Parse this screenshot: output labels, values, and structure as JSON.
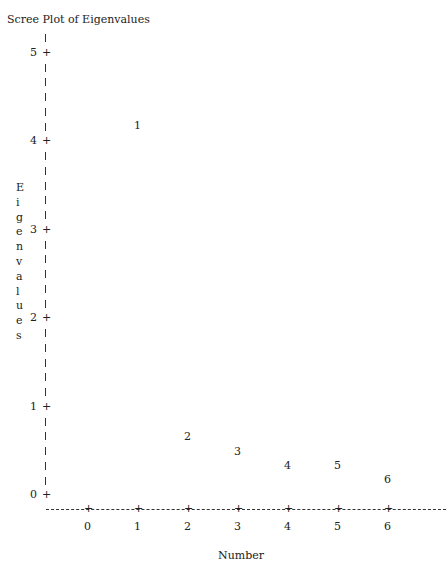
{
  "chart_data": {
    "type": "scatter",
    "title": "Scree Plot of Eigenvalues",
    "xlabel": "Number",
    "ylabel": "Eigenvalues",
    "x_ticks": [
      "0",
      "1",
      "2",
      "3",
      "4",
      "5",
      "6"
    ],
    "y_ticks": [
      "0",
      "1",
      "2",
      "3",
      "4",
      "5"
    ],
    "xlim": [
      -0.5,
      6.5
    ],
    "ylim": [
      0,
      5
    ],
    "grid": false,
    "points": [
      {
        "label": "1",
        "x": 1,
        "y": 4.17
      },
      {
        "label": "2",
        "x": 2,
        "y": 0.66
      },
      {
        "label": "3",
        "x": 3,
        "y": 0.49
      },
      {
        "label": "4",
        "x": 4,
        "y": 0.33
      },
      {
        "label": "5",
        "x": 5,
        "y": 0.33
      },
      {
        "label": "6",
        "x": 6,
        "y": 0.17
      }
    ]
  },
  "labels": {
    "title": "Scree Plot of Eigenvalues",
    "xlabel": "Number",
    "ylabel_chars": [
      "E",
      "i",
      "g",
      "e",
      "n",
      "v",
      "a",
      "l",
      "u",
      "e",
      "s"
    ]
  }
}
